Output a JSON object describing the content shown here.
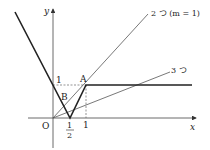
{
  "diagram": {
    "axes": {
      "x_label": "x",
      "y_label": "y",
      "origin_label": "O"
    },
    "ticks": {
      "y_one": "1",
      "x_half_num": "1",
      "x_half_den": "2",
      "x_one": "1"
    },
    "points": {
      "A": "A",
      "B": "B"
    },
    "line_labels": {
      "line_two": "2 つ (m = 1)",
      "line_three": "3 つ"
    },
    "colors": {
      "stroke": "#222222",
      "thin": "#555555",
      "dashed": "#666666"
    }
  }
}
